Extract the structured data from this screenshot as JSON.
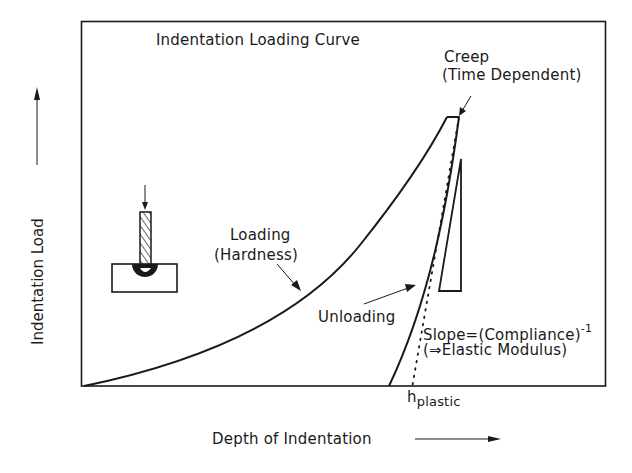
{
  "diagram": {
    "title": "Indentation Loading Curve",
    "x_axis_label": "Depth of Indentation",
    "y_axis_label": "Indentation Load",
    "annotations": {
      "creep_line1": "Creep",
      "creep_line2": "(Time Dependent)",
      "loading_line1": "Loading",
      "loading_line2": "(Hardness)",
      "unloading": "Unloading",
      "slope_line1": "Slope=(Compliance)",
      "slope_superscript": "-1",
      "slope_line2": "(⇒Elastic Modulus)",
      "h_symbol": "h",
      "h_subscript": "plastic"
    },
    "elements": [
      {
        "name": "loading-curve",
        "description": "Concave-up curve from origin to peak load"
      },
      {
        "name": "creep-plateau",
        "description": "Short horizontal segment at peak load"
      },
      {
        "name": "unloading-curve",
        "description": "Steep curve from peak back to baseline at h_plastic region"
      },
      {
        "name": "tangent-dotted-line",
        "description": "Dotted tangent to initial unloading, intersecting baseline at h_plastic"
      },
      {
        "name": "slope-triangle",
        "description": "Right triangle indicating unloading slope"
      },
      {
        "name": "indenter-sketch",
        "description": "Hatched indenter pressing into a specimen block"
      }
    ],
    "colors": {
      "ink": "#1a1a1a",
      "background": "#ffffff"
    }
  }
}
